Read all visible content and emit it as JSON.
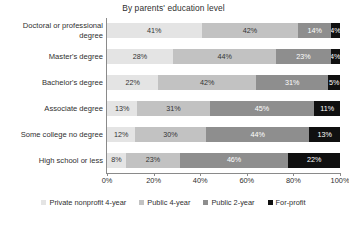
{
  "chart_data": {
    "type": "bar",
    "orientation": "horizontal",
    "stacked": true,
    "normalized_percent": true,
    "title": "By parents' education level",
    "xlabel": "",
    "ylabel": "",
    "xlim": [
      0,
      100
    ],
    "grid": false,
    "legend_position": "bottom",
    "categories": [
      "Doctoral or professional degree",
      "Master's degree",
      "Bachelor's degree",
      "Associate degree",
      "Some college no degree",
      "High school or less"
    ],
    "xticks": [
      "0%",
      "20%",
      "40%",
      "60%",
      "80%",
      "100%"
    ],
    "xtick_values": [
      0,
      20,
      40,
      60,
      80,
      100
    ],
    "series": [
      {
        "name": "Private nonprofit 4-year",
        "color": "#e4e4e4",
        "values": [
          41,
          28,
          22,
          13,
          12,
          8
        ],
        "labels": [
          "41%",
          "28%",
          "22%",
          "13%",
          "12%",
          "8%"
        ]
      },
      {
        "name": "Public 4-year",
        "color": "#c2c2c2",
        "values": [
          42,
          44,
          42,
          31,
          30,
          23
        ],
        "labels": [
          "42%",
          "44%",
          "42%",
          "31%",
          "30%",
          "23%"
        ]
      },
      {
        "name": "Public 2-year",
        "color": "#8e8e8e",
        "values": [
          14,
          23,
          31,
          45,
          44,
          46
        ],
        "labels": [
          "14%",
          "23%",
          "31%",
          "45%",
          "44%",
          "46%"
        ]
      },
      {
        "name": "For-profit",
        "color": "#101010",
        "values": [
          4,
          4,
          5,
          11,
          13,
          22
        ],
        "labels": [
          "4%",
          "4%",
          "5%",
          "11%",
          "13%",
          "22%"
        ]
      }
    ]
  },
  "legend": {
    "items": [
      {
        "label": "Private nonprofit 4-year",
        "color": "#e4e4e4"
      },
      {
        "label": "Public 4-year",
        "color": "#c2c2c2"
      },
      {
        "label": "Public 2-year",
        "color": "#8e8e8e"
      },
      {
        "label": "For-profit",
        "color": "#101010"
      }
    ]
  }
}
